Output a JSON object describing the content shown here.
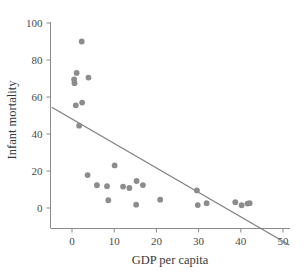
{
  "chart_data": {
    "type": "scatter",
    "title": "",
    "subtitle": "",
    "xlabel": "GDP per capita",
    "ylabel": "Infant mortality",
    "xlim": [
      -5,
      52
    ],
    "ylim": [
      -8,
      104
    ],
    "xticks": [
      0,
      10,
      20,
      30,
      40,
      50
    ],
    "yticks": [
      0,
      20,
      40,
      60,
      80,
      100
    ],
    "xtick_labels": [
      "0",
      "10",
      "20",
      "30",
      "40",
      "50"
    ],
    "ytick_labels": [
      "0",
      "20",
      "40",
      "60",
      "80",
      "100"
    ],
    "grid": false,
    "legend": "none",
    "point_color": "#8c8c8c",
    "line_color": "#7c7c7c",
    "axis_color": "#8a8a8a",
    "text_color": "#3c3c3c",
    "series": [
      {
        "name": "Countries",
        "marker": "circle",
        "points": [
          {
            "x": 2.3,
            "y": 90.0
          },
          {
            "x": 1.1,
            "y": 73.0
          },
          {
            "x": 0.5,
            "y": 69.5
          },
          {
            "x": 0.6,
            "y": 67.5
          },
          {
            "x": 3.9,
            "y": 70.5
          },
          {
            "x": 0.9,
            "y": 55.5
          },
          {
            "x": 2.4,
            "y": 57.0
          },
          {
            "x": 1.7,
            "y": 44.5
          },
          {
            "x": 3.7,
            "y": 17.8
          },
          {
            "x": 5.9,
            "y": 12.3
          },
          {
            "x": 8.3,
            "y": 11.8
          },
          {
            "x": 8.6,
            "y": 4.2
          },
          {
            "x": 10.1,
            "y": 23.0
          },
          {
            "x": 12.1,
            "y": 11.6
          },
          {
            "x": 13.6,
            "y": 10.8
          },
          {
            "x": 15.2,
            "y": 1.8
          },
          {
            "x": 15.3,
            "y": 14.6
          },
          {
            "x": 16.8,
            "y": 12.4
          },
          {
            "x": 20.9,
            "y": 4.5
          },
          {
            "x": 29.6,
            "y": 9.5
          },
          {
            "x": 29.8,
            "y": 1.6
          },
          {
            "x": 31.9,
            "y": 2.6
          },
          {
            "x": 38.7,
            "y": 3.1
          },
          {
            "x": 40.2,
            "y": 1.5
          },
          {
            "x": 41.6,
            "y": 2.4
          },
          {
            "x": 42.1,
            "y": 2.6
          }
        ]
      }
    ],
    "trend_line": {
      "name": "linear fit",
      "x_start": -4.8,
      "y_start": 54.5,
      "x_end": 51.5,
      "y_end": -20.0
    }
  }
}
